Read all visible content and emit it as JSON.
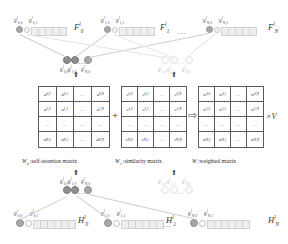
{
  "figure": {
    "type": "diagram",
    "title_visible": false
  },
  "top_row": {
    "groups": [
      {
        "id": "F0",
        "big_label": "F",
        "big_sup": "l",
        "big_sub": "0",
        "node_labels": [
          {
            "base": "g",
            "sup": "l",
            "sub": "0,0"
          },
          {
            "base": "g",
            "sup": "l",
            "sub": "0,1"
          }
        ],
        "cells": 5
      },
      {
        "id": "F1",
        "big_label": "F",
        "big_sup": "l",
        "big_sub": "1",
        "node_labels": [
          {
            "base": "g",
            "sup": "l",
            "sub": "1,0"
          },
          {
            "base": "g",
            "sup": "l",
            "sub": "1,1"
          }
        ],
        "cells": 5
      },
      {
        "id": "FN",
        "big_label": "F",
        "big_sup": "l",
        "big_sub": "N",
        "node_labels": [
          {
            "base": "g",
            "sup": "l",
            "sub": "N,0"
          },
          {
            "base": "g",
            "sup": "l",
            "sub": "N,1"
          }
        ],
        "cells": 5
      }
    ],
    "ellipsis": "..."
  },
  "mid_upper": {
    "left_group": {
      "labels": [
        {
          "base": "g",
          "sup": "l",
          "sub": "0,0"
        },
        {
          "base": "g",
          "sup": "l",
          "sub": "1,0"
        },
        {
          "base": "g",
          "sup": "l",
          "sub": "N,0"
        }
      ],
      "ellipsis": "..."
    },
    "right_group": {
      "labels": [
        {
          "base": "g",
          "sup": "l",
          "sub": "0,1"
        },
        {
          "base": "g",
          "sup": "l",
          "sub": "1,1"
        },
        {
          "base": "g",
          "sup": "l",
          "sub": "N,1"
        }
      ],
      "ellipsis": "..."
    },
    "arrow": "⬆"
  },
  "matrices": [
    {
      "id": "Wa",
      "symbol": "W",
      "symbol_sub": "a",
      "caption": ":self-attention matrix",
      "letter": "a",
      "rows": [
        [
          "a,0,0",
          "a,0,1",
          "...",
          "a,0,N"
        ],
        [
          "a,1,0",
          "a,1,1",
          "...",
          "a,1,N"
        ],
        [
          "...",
          "...",
          "...",
          "..."
        ],
        [
          "a,N,0",
          "a,N,1",
          "...",
          "a,N,N"
        ]
      ]
    },
    {
      "id": "Wc",
      "symbol": "W",
      "symbol_sub": "c",
      "caption": ":similarity matrix",
      "letter": "c",
      "rows": [
        [
          "c,0,0",
          "c,0,1",
          "...",
          "c,0,N"
        ],
        [
          "c,1,0",
          "c,1,1",
          "...",
          "c,1,N"
        ],
        [
          "...",
          "...",
          "...",
          "..."
        ],
        [
          "c,N,0",
          "c,N,1",
          "...",
          "c,N,N"
        ]
      ]
    },
    {
      "id": "W",
      "symbol": "W",
      "symbol_sub": "",
      "caption": ":weighted matrix",
      "letter": "w",
      "rows": [
        [
          "w,0,0",
          "w,0,1",
          "...",
          "w,0,N"
        ],
        [
          "w,1,0",
          "w,1,1",
          "...",
          "w,1,N"
        ],
        [
          "...",
          "...",
          "...",
          "..."
        ],
        [
          "w,N,0",
          "w,N,1",
          "...",
          "w,N,N"
        ]
      ]
    }
  ],
  "operators": {
    "plus": "+",
    "implies": "⇨",
    "times_v": "×V"
  },
  "mid_lower": {
    "left_group": {
      "labels": [
        {
          "base": "g",
          "sup": "l",
          "sub": "0,0"
        },
        {
          "base": "g",
          "sup": "l",
          "sub": "1,0"
        },
        {
          "base": "g",
          "sup": "l",
          "sub": "N,0"
        }
      ],
      "ellipsis": "..."
    },
    "right_group": {
      "labels": [
        {
          "base": "g",
          "sup": "l",
          "sub": "0,1"
        },
        {
          "base": "g",
          "sup": "l",
          "sub": "1,1"
        },
        {
          "base": "g",
          "sup": "l",
          "sub": "N,1"
        }
      ],
      "ellipsis": "..."
    },
    "arrow": "⬆"
  },
  "bottom_row": {
    "groups": [
      {
        "id": "H0",
        "big_label": "H",
        "big_sup": "l",
        "big_sub": "0",
        "node_labels": [
          {
            "base": "g",
            "sup": "l",
            "sub": "0,0"
          },
          {
            "base": "g",
            "sup": "l",
            "sub": "0,1"
          }
        ],
        "cells": 6
      },
      {
        "id": "H1",
        "big_label": "H",
        "big_sup": "l",
        "big_sub": "1",
        "node_labels": [
          {
            "base": "g",
            "sup": "l",
            "sub": "1,0"
          },
          {
            "base": "g",
            "sup": "l",
            "sub": "1,1"
          }
        ],
        "cells": 6
      },
      {
        "id": "HN",
        "big_label": "H",
        "big_sup": "l",
        "big_sub": "N",
        "node_labels": [
          {
            "base": "g",
            "sup": "l",
            "sub": "N,0"
          },
          {
            "base": "g",
            "sup": "l",
            "sub": "N,1"
          }
        ],
        "cells": 6
      }
    ],
    "ellipsis": "..."
  },
  "colors": {
    "node_dark": "#a8a8a8",
    "node_darker": "#8f8f8f",
    "node_light": "#f3f3f3",
    "node_white": "#ffffff",
    "cell_fill": "#eeeeee",
    "cell_border": "#d2d2d2",
    "matrix_border": "#5a5a5a",
    "edge": "#cfcfcf",
    "text": "#2e2e2e"
  }
}
